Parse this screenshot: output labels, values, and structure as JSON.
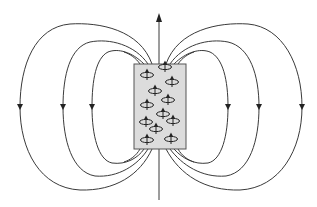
{
  "diagram": {
    "colors": {
      "background": "#ffffff",
      "line": "#3a3a3a",
      "magnet_fill": "#dcdcdc",
      "magnet_stroke": "#555555",
      "dipole": "#222222"
    },
    "axis": {
      "x": 159,
      "y_top": 14,
      "y_bottom": 200,
      "arrow_direction": "up"
    },
    "magnet": {
      "x": 134,
      "y": 64,
      "width": 52,
      "height": 85
    },
    "field_loops": {
      "left": [
        {
          "name": "outer",
          "x_extreme": 20,
          "top_y": 23,
          "bottom_y": 190,
          "arrow_direction": "down"
        },
        {
          "name": "middle",
          "x_extreme": 63,
          "top_y": 40,
          "bottom_y": 176,
          "arrow_direction": "down"
        },
        {
          "name": "inner",
          "x_extreme": 92,
          "top_y": 50,
          "bottom_y": 164,
          "arrow_direction": "down"
        }
      ],
      "right": [
        {
          "name": "inner",
          "x_extreme": 228,
          "top_y": 50,
          "bottom_y": 164,
          "arrow_direction": "down"
        },
        {
          "name": "middle",
          "x_extreme": 259,
          "top_y": 40,
          "bottom_y": 176,
          "arrow_direction": "down"
        },
        {
          "name": "outer",
          "x_extreme": 302,
          "top_y": 23,
          "bottom_y": 190,
          "arrow_direction": "down"
        }
      ]
    },
    "dipoles": [
      {
        "x": 147,
        "y": 75
      },
      {
        "x": 165,
        "y": 67
      },
      {
        "x": 172,
        "y": 82
      },
      {
        "x": 155,
        "y": 91
      },
      {
        "x": 168,
        "y": 100
      },
      {
        "x": 147,
        "y": 105
      },
      {
        "x": 163,
        "y": 114
      },
      {
        "x": 146,
        "y": 122
      },
      {
        "x": 173,
        "y": 121
      },
      {
        "x": 156,
        "y": 129
      },
      {
        "x": 147,
        "y": 140
      },
      {
        "x": 171,
        "y": 139
      }
    ],
    "dipole_symbol": "ellipse-with-upward-arrow-icon"
  }
}
